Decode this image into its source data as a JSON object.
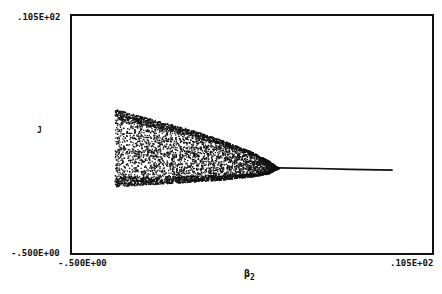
{
  "chart_data": {
    "type": "scatter",
    "title": "",
    "xlabel": "β2",
    "ylabel": "J",
    "x_tick_labels": {
      "min": "-.500E+00",
      "max": ".105E+02"
    },
    "y_tick_labels": {
      "min": "-.500E+00",
      "max": ".105E+02"
    },
    "xlim": [
      -0.5,
      10.5
    ],
    "ylim": [
      -0.5,
      10.5
    ],
    "grid": false,
    "legend": null,
    "chaotic_band": {
      "x_start": 0.8,
      "x_end": 5.8,
      "upper_envelope": [
        [
          0.8,
          6.2
        ],
        [
          2.0,
          5.7
        ],
        [
          3.0,
          5.3
        ],
        [
          4.0,
          4.8
        ],
        [
          5.0,
          4.2
        ],
        [
          5.5,
          3.8
        ],
        [
          5.8,
          3.45
        ]
      ],
      "lower_envelope": [
        [
          0.8,
          2.6
        ],
        [
          2.0,
          2.7
        ],
        [
          3.0,
          2.8
        ],
        [
          4.0,
          2.9
        ],
        [
          5.0,
          3.05
        ],
        [
          5.5,
          3.2
        ],
        [
          5.8,
          3.45
        ]
      ]
    },
    "fixed_branch": [
      [
        5.8,
        3.45
      ],
      [
        7.0,
        3.42
      ],
      [
        8.0,
        3.38
      ],
      [
        9.3,
        3.35
      ]
    ]
  },
  "colors": {
    "ink": "#111111",
    "background": "#ffffff"
  }
}
